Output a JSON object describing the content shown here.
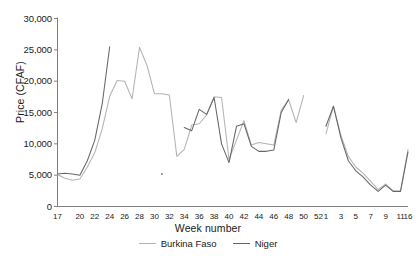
{
  "chart_data": {
    "type": "line",
    "title": "",
    "xlabel": "Week number",
    "ylabel": "Price (CFAF)",
    "ylim": [
      0,
      30000
    ],
    "ytick_labels": [
      "30,000",
      "25,000",
      "20,000",
      "15,000",
      "10,000",
      "5,000",
      "0"
    ],
    "ytick_values": [
      30000,
      25000,
      20000,
      15000,
      10000,
      5000,
      0
    ],
    "grid": false,
    "legend_position": "bottom-center",
    "categories": [
      "17",
      "18",
      "19",
      "20",
      "21",
      "22",
      "23",
      "24",
      "25",
      "26",
      "27",
      "28",
      "29",
      "30",
      "31",
      "32",
      "33",
      "34",
      "35",
      "36",
      "37",
      "38",
      "39",
      "40",
      "41",
      "42",
      "43",
      "44",
      "45",
      "46",
      "47",
      "48",
      "49",
      "50",
      "51",
      "52",
      "1",
      "2",
      "3",
      "4",
      "5",
      "6",
      "7",
      "8",
      "9",
      "10",
      "11",
      "16"
    ],
    "series": [
      {
        "name": "Burkina Faso",
        "color": "#b3b3b3",
        "values": [
          5100,
          4500,
          4200,
          4400,
          6300,
          8600,
          12400,
          17600,
          20100,
          20000,
          17200,
          25400,
          22500,
          18000,
          18000,
          17800,
          8000,
          9100,
          13000,
          13200,
          14600,
          17500,
          17400,
          7500,
          10600,
          13700,
          9800,
          10200,
          10000,
          9800,
          15400,
          17000,
          13400,
          17700,
          null,
          null,
          11600,
          16000,
          11400,
          8000,
          6300,
          5300,
          4000,
          2700,
          3600,
          2500,
          2500,
          9100
        ]
      },
      {
        "name": "Niger",
        "color": "#666666",
        "values": [
          5200,
          5300,
          5200,
          5000,
          7300,
          10600,
          16400,
          25500,
          null,
          null,
          null,
          null,
          null,
          null,
          5200,
          null,
          null,
          12600,
          12100,
          15500,
          14700,
          17400,
          10000,
          7000,
          12800,
          13200,
          9600,
          8800,
          8800,
          9000,
          15000,
          17100,
          null,
          null,
          null,
          null,
          12800,
          16000,
          11000,
          7300,
          5700,
          4700,
          3400,
          2400,
          3400,
          2400,
          2400,
          8700
        ]
      }
    ],
    "xtick_labels": [
      "17",
      "20",
      "22",
      "24",
      "26",
      "28",
      "30",
      "32",
      "34",
      "36",
      "38",
      "40",
      "42",
      "44",
      "46",
      "48",
      "50",
      "52",
      "1",
      "3",
      "5",
      "7",
      "9",
      "11",
      "16"
    ],
    "xtick_indices": [
      0,
      3,
      5,
      7,
      9,
      11,
      13,
      15,
      17,
      19,
      21,
      23,
      25,
      27,
      29,
      31,
      33,
      35,
      36,
      38,
      40,
      42,
      44,
      46,
      47
    ]
  },
  "legend": {
    "items": [
      {
        "label": "Burkina Faso"
      },
      {
        "label": "Niger"
      }
    ]
  },
  "axes": {
    "x_title": "Week number",
    "y_title": "Price (CFAF)"
  },
  "colors": {
    "burkina_faso": "#b3b3b3",
    "niger": "#666666",
    "axis": "#808080",
    "text": "#1a1a1a"
  }
}
